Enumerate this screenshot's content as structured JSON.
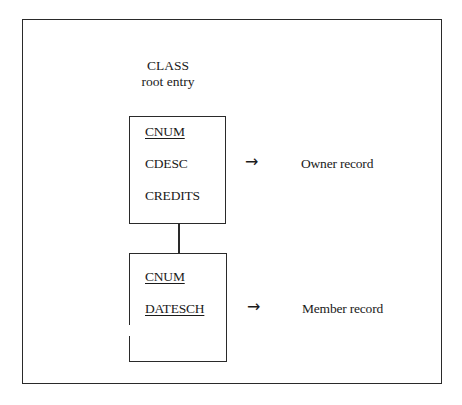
{
  "diagram": {
    "title": {
      "line1": "CLASS",
      "line2": "root entry"
    },
    "owner_segment": {
      "fields": [
        {
          "name": "CNUM",
          "key": true
        },
        {
          "name": "CDESC",
          "key": false
        },
        {
          "name": "CREDITS",
          "key": false
        }
      ],
      "arrow": "→",
      "label": "Owner record"
    },
    "member_segment": {
      "fields": [
        {
          "name": "CNUM",
          "key": true
        },
        {
          "name": "DATESCH",
          "key": true
        }
      ],
      "arrow": "→",
      "label": "Member record"
    }
  }
}
